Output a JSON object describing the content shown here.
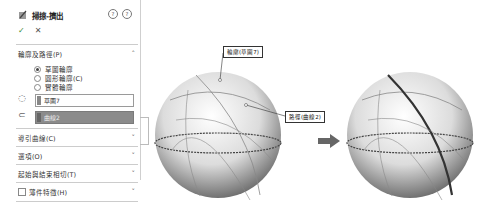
{
  "panel": {
    "title": "掃掠-擠出",
    "help_icons": [
      "detailed-help-icon",
      "help-icon"
    ],
    "ok_symbol": "✓",
    "cancel_symbol": "✕",
    "sections": [
      {
        "label": "輪廓及路徑(P)",
        "chevron": "˄",
        "expanded": true
      },
      {
        "label": "導引曲線(C)",
        "chevron": "˅"
      },
      {
        "label": "選項(O)",
        "chevron": "˅"
      },
      {
        "label": "起始與結束相切(T)",
        "chevron": "˅"
      },
      {
        "label": "薄件特徵(H)",
        "chevron": "˅",
        "checkbox": true
      }
    ],
    "radios": [
      {
        "label": "草圖輪廓",
        "checked": true
      },
      {
        "label": "圓形輪廓(C)",
        "checked": false
      },
      {
        "label": "實體輪廓",
        "checked": false
      }
    ],
    "profile_field": {
      "value": "草圖7"
    },
    "path_field": {
      "value": "曲線2"
    }
  },
  "canvas": {
    "callouts": [
      {
        "label": "輪廓(草圖7)"
      },
      {
        "label": "路徑(曲線2)"
      }
    ],
    "arrow": "right-arrow",
    "colors": {
      "sphere_light": "#f4f4f4",
      "sphere_dark": "#6a6a6a",
      "arrow": "#666666"
    }
  }
}
